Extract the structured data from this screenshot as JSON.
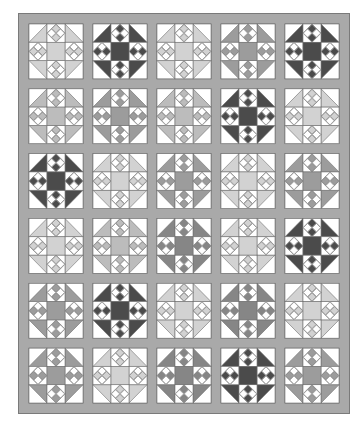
{
  "quilt": {
    "columns": 5,
    "rows": 6,
    "frame_color": "#a9a9a9",
    "frame_edge_color": "#7a7a7a",
    "background_color": "#ffffff",
    "line_color": "#6e6e6e",
    "shades": {
      "light": "#d2d2d2",
      "midlight": "#bcbcbc",
      "mid": "#9c9c9c",
      "middark": "#868686",
      "dark": "#4b4b4b"
    },
    "blocks": [
      [
        "light",
        "dark",
        "light",
        "mid",
        "dark"
      ],
      [
        "midlight",
        "mid",
        "midlight",
        "dark",
        "light"
      ],
      [
        "dark",
        "light",
        "mid",
        "light",
        "mid"
      ],
      [
        "light",
        "midlight",
        "middark",
        "light",
        "dark"
      ],
      [
        "mid",
        "dark",
        "light",
        "middark",
        "light"
      ],
      [
        "mid",
        "light",
        "middark",
        "dark",
        "mid"
      ]
    ]
  }
}
